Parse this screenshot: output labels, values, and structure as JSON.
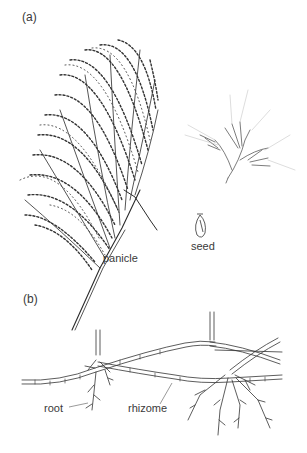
{
  "figure": {
    "panel_a": {
      "label": "(a)",
      "parts": {
        "panicle": "panicle",
        "seed": "seed"
      }
    },
    "panel_b": {
      "label": "(b)",
      "parts": {
        "root": "root",
        "rhizome": "rhizome"
      }
    }
  }
}
